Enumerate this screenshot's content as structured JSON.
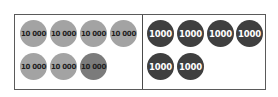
{
  "diagram": {
    "type": "place-value counters",
    "left_panel": {
      "counter_label": "10 000",
      "count": 7,
      "counters": [
        {
          "label": "10 000",
          "shade": "light"
        },
        {
          "label": "10 000",
          "shade": "light"
        },
        {
          "label": "10 000",
          "shade": "light"
        },
        {
          "label": "10 000",
          "shade": "light"
        },
        {
          "label": "10 000",
          "shade": "light"
        },
        {
          "label": "10 000",
          "shade": "light"
        },
        {
          "label": "10 000",
          "shade": "dark"
        }
      ]
    },
    "right_panel": {
      "counter_label": "1000",
      "count": 6,
      "counters": [
        {
          "label": "1000"
        },
        {
          "label": "1000"
        },
        {
          "label": "1000"
        },
        {
          "label": "1000"
        },
        {
          "label": "1000"
        },
        {
          "label": "1000"
        }
      ]
    },
    "colors": {
      "ten_thousand_light": "#a3a3a3",
      "ten_thousand_dark": "#7b7b7b",
      "thousand": "#3f3f3f",
      "border": "#5a5a5a"
    }
  }
}
